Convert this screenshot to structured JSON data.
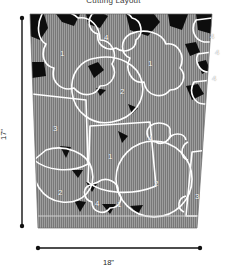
{
  "diagram": {
    "caption": "Cutting Layout",
    "fabric": {
      "fill_color": "#7a7a7a",
      "grain_line_color": "#9d9d9d",
      "waste_color": "#0d0d0d",
      "piece_outline_color": "#ffffff",
      "top_width_px": 182,
      "bottom_width_px": 148
    },
    "dimensions": {
      "height_label": "17\"",
      "width_label": "18\"",
      "marker_color": "#111111"
    },
    "pieces": [
      {
        "id": "p1-a",
        "number": "1",
        "x": 60,
        "y": 49
      },
      {
        "id": "p1-b",
        "number": "1",
        "x": 148,
        "y": 59
      },
      {
        "id": "p1-c",
        "number": "1",
        "x": 108,
        "y": 152
      },
      {
        "id": "p1-d",
        "number": "1",
        "x": 117,
        "y": 200
      },
      {
        "id": "p2-a",
        "number": "2",
        "x": 120,
        "y": 87
      },
      {
        "id": "p2-b",
        "number": "2",
        "x": 58,
        "y": 188
      },
      {
        "id": "p2-c",
        "number": "2",
        "x": 154,
        "y": 179
      },
      {
        "id": "p3-a",
        "number": "3",
        "x": 53,
        "y": 124
      },
      {
        "id": "p3-b",
        "number": "3",
        "x": 195,
        "y": 192
      },
      {
        "id": "p4-a",
        "number": "4",
        "x": 104,
        "y": 33
      },
      {
        "id": "p4-b",
        "number": "4",
        "x": 210,
        "y": 32
      },
      {
        "id": "p4-c",
        "number": "4",
        "x": 215,
        "y": 48
      },
      {
        "id": "p4-d",
        "number": "4",
        "x": 212,
        "y": 74
      },
      {
        "id": "p4-e",
        "number": "4",
        "x": 95,
        "y": 199
      },
      {
        "id": "p4-f",
        "number": "4",
        "x": 148,
        "y": 134
      }
    ]
  }
}
